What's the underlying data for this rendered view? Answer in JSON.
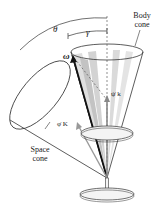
{
  "figure": {
    "labels": {
      "theta": "θ",
      "gamma": "γ",
      "body_cone_line1": "Body",
      "body_cone_line2": "cone",
      "space_cone_line1": "Space",
      "space_cone_line2": "cone",
      "omega": "ω",
      "psi_dot_k": "ψ̇ k",
      "phi_dot_K": "φ̇ K"
    },
    "colors": {
      "line": "#222222",
      "shade_light": "#d8d8d8",
      "shade_mid": "#b8b8b8",
      "arrow_gray": "#888888"
    }
  }
}
